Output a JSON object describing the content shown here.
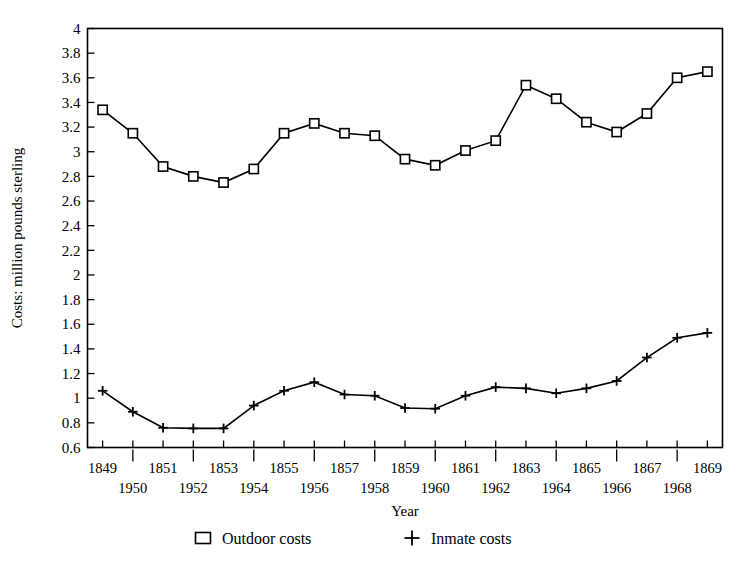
{
  "chart_data": {
    "type": "line",
    "title": "",
    "xlabel": "Year",
    "ylabel": "Costs: million pounds sterling",
    "x": [
      1849,
      1850,
      1851,
      1852,
      1853,
      1854,
      1855,
      1856,
      1857,
      1858,
      1859,
      1860,
      1861,
      1862,
      1863,
      1864,
      1865,
      1866,
      1867,
      1868,
      1869
    ],
    "xlim": [
      1848.5,
      1869.5
    ],
    "ylim": [
      0.6,
      4
    ],
    "ytick_labels": [
      "0.6",
      "0.8",
      "1",
      "1.2",
      "1.4",
      "1.6",
      "1.8",
      "2",
      "2.2",
      "2.4",
      "2.6",
      "2.8",
      "3",
      "3.2",
      "3.4",
      "3.6",
      "3.8",
      "4"
    ],
    "ytick_values": [
      0.6,
      0.8,
      1.0,
      1.2,
      1.4,
      1.6,
      1.8,
      2.0,
      2.2,
      2.4,
      2.6,
      2.8,
      3.0,
      3.2,
      3.4,
      3.6,
      3.8,
      4.0
    ],
    "xtick_labels_upper": [
      "1849",
      "1851",
      "1853",
      "1855",
      "1857",
      "1859",
      "1861",
      "1863",
      "1865",
      "1867",
      "1869"
    ],
    "xtick_values_upper": [
      1849,
      1851,
      1853,
      1855,
      1857,
      1859,
      1861,
      1863,
      1865,
      1867,
      1869
    ],
    "xtick_labels_lower": [
      "1950",
      "1952",
      "1954",
      "1956",
      "1958",
      "1960",
      "1962",
      "1964",
      "1966",
      "1968"
    ],
    "xtick_values_lower": [
      1850,
      1852,
      1854,
      1856,
      1858,
      1860,
      1862,
      1864,
      1866,
      1868
    ],
    "grid": false,
    "legend_position": "bottom-center",
    "series": [
      {
        "name": "Outdoor costs",
        "marker": "square",
        "values": [
          3.34,
          3.15,
          2.88,
          2.8,
          2.75,
          2.86,
          3.15,
          3.23,
          3.15,
          3.13,
          2.94,
          2.89,
          3.01,
          3.09,
          3.54,
          3.43,
          3.24,
          3.16,
          3.31,
          3.6,
          3.65
        ]
      },
      {
        "name": "Inmate costs",
        "marker": "plus",
        "values": [
          1.06,
          0.89,
          0.76,
          0.755,
          0.755,
          0.94,
          1.06,
          1.13,
          1.03,
          1.02,
          0.92,
          0.915,
          1.02,
          1.09,
          1.08,
          1.04,
          1.08,
          1.14,
          1.33,
          1.49,
          1.53
        ]
      }
    ]
  },
  "legend": {
    "entries": [
      {
        "label": "Outdoor costs",
        "marker": "square"
      },
      {
        "label": "Inmate costs",
        "marker": "plus"
      }
    ]
  }
}
